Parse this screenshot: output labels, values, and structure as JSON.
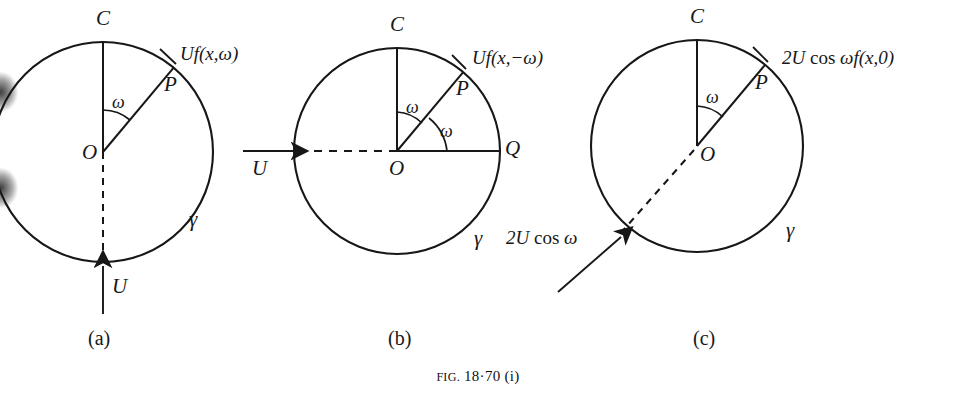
{
  "figure": {
    "caption_prefix": "Fig.",
    "caption_number": "18·70",
    "caption_suffix": "(i)",
    "caption_full": "Fig. 18·70 (i)",
    "background_color": "#ffffff",
    "ink_color": "#171717"
  },
  "panels": [
    {
      "id": "a",
      "label": "(a)",
      "circle_label": "γ",
      "center_label": "O",
      "top_label": "C",
      "point_label": "P",
      "angle_label": "ω",
      "flow_label": "U",
      "expression": "Uf(x,ω)",
      "expression_parts": {
        "lead": "Uf",
        "args": "(x,ω)"
      },
      "circle": {
        "cx": 103,
        "cy": 152,
        "r": 110
      },
      "arrow": {
        "from": [
          103,
          312
        ],
        "to": [
          103,
          262
        ],
        "direction": "up"
      },
      "dashed_radius_angle_deg": 180,
      "radius_angle_deg": 40
    },
    {
      "id": "b",
      "label": "(b)",
      "circle_label": "γ",
      "center_label": "O",
      "top_label": "C",
      "point_label": "P",
      "right_label": "Q",
      "angle_label_upper": "ω",
      "angle_label_lower": "ω",
      "flow_label": "U",
      "expression": "Uf(x,−ω)",
      "expression_parts": {
        "lead": "Uf",
        "args": "(x,−ω)"
      },
      "circle": {
        "cx": 397,
        "cy": 151,
        "r": 103
      },
      "arrow": {
        "from": [
          245,
          151
        ],
        "to": [
          298,
          151
        ],
        "direction": "right"
      },
      "dashed_radius_angle_deg": 180,
      "radius_angle_deg": 40
    },
    {
      "id": "c",
      "label": "(c)",
      "circle_label": "γ",
      "center_label": "O",
      "top_label": "C",
      "point_label": "P",
      "angle_label": "ω",
      "flow_label": "2U cos ω",
      "flow_label_parts": {
        "lead": "2U",
        "fn": "cos",
        "arg": "ω"
      },
      "expression": "2U cos ωf(x,0)",
      "expression_parts": {
        "lead": "2U",
        "fn": "cos",
        "arg": "ωf",
        "args": "(x,0)"
      },
      "circle": {
        "cx": 697,
        "cy": 146,
        "r": 106
      },
      "arrow": {
        "from": [
          560,
          290
        ],
        "to": [
          620,
          238
        ],
        "direction": "up-right"
      },
      "dashed_radius_angle_deg": 220,
      "radius_angle_deg": 40
    }
  ]
}
